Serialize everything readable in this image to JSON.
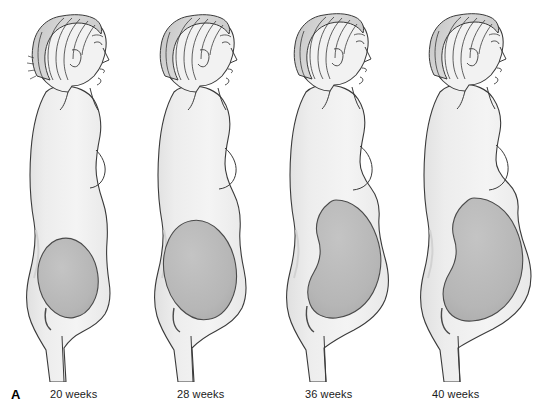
{
  "figure": {
    "plate_letter": "A",
    "background_color": "#ffffff",
    "ink_color": "#2b2b2b",
    "body_fill_color": "#f1f1f1",
    "body_shade_color": "#e2e2e2",
    "hair_fill_color": "#cfcfcf",
    "hair_strand_color": "#3a3a3a",
    "uterus_fill_color": "#b6b6b6",
    "uterus_outline_color": "#4a4a4a",
    "caption_color": "#1a1a1a"
  },
  "panels": [
    {
      "id": "panel-20-weeks",
      "caption": "20 weeks",
      "caption_x": 50,
      "panel_x": 6,
      "panel_width": 136,
      "uterus": {
        "rx": 30,
        "ry": 40,
        "cx": 62,
        "cy": 278,
        "fundal_height_label": "umbilicus"
      }
    },
    {
      "id": "panel-28-weeks",
      "caption": "28 weeks",
      "caption_x": 177,
      "panel_x": 136,
      "panel_width": 136,
      "uterus": {
        "rx": 36,
        "ry": 50,
        "cx": 64,
        "cy": 270,
        "fundal_height_label": "above umbilicus"
      }
    },
    {
      "id": "panel-36-weeks",
      "caption": "36 weeks",
      "caption_x": 305,
      "panel_x": 270,
      "panel_width": 140,
      "uterus": {
        "rx": 43,
        "ry": 62,
        "cx": 66,
        "cy": 262,
        "fundal_height_label": "xiphoid process"
      }
    },
    {
      "id": "panel-40-weeks",
      "caption": "40 weeks",
      "caption_x": 432,
      "panel_x": 404,
      "panel_width": 148,
      "uterus": {
        "rx": 48,
        "ry": 66,
        "cx": 70,
        "cy": 264,
        "fundal_height_label": "lightening / descended"
      }
    }
  ]
}
